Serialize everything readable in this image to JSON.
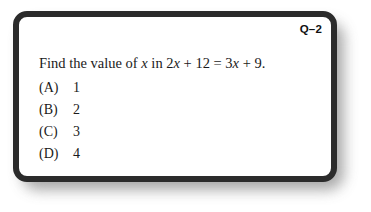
{
  "page": {
    "background_color": "#ffffff"
  },
  "card": {
    "border_color": "#2b2b2b",
    "background_color": "#ffffff",
    "shadow_color": "#9a9a9a"
  },
  "header": {
    "question_label": "Q–2"
  },
  "question": {
    "prefix": "Find the value of ",
    "var1": "x",
    "mid": " in 2",
    "var2": "x",
    "mid2": " + 12 = 3",
    "var3": "x",
    "suffix": " + 9.",
    "full_text": "Find the value of x in 2x + 12 = 3x + 9."
  },
  "options": [
    {
      "key": "(A)",
      "value": "1"
    },
    {
      "key": "(B)",
      "value": "2"
    },
    {
      "key": "(C)",
      "value": "3"
    },
    {
      "key": "(D)",
      "value": "4"
    }
  ]
}
